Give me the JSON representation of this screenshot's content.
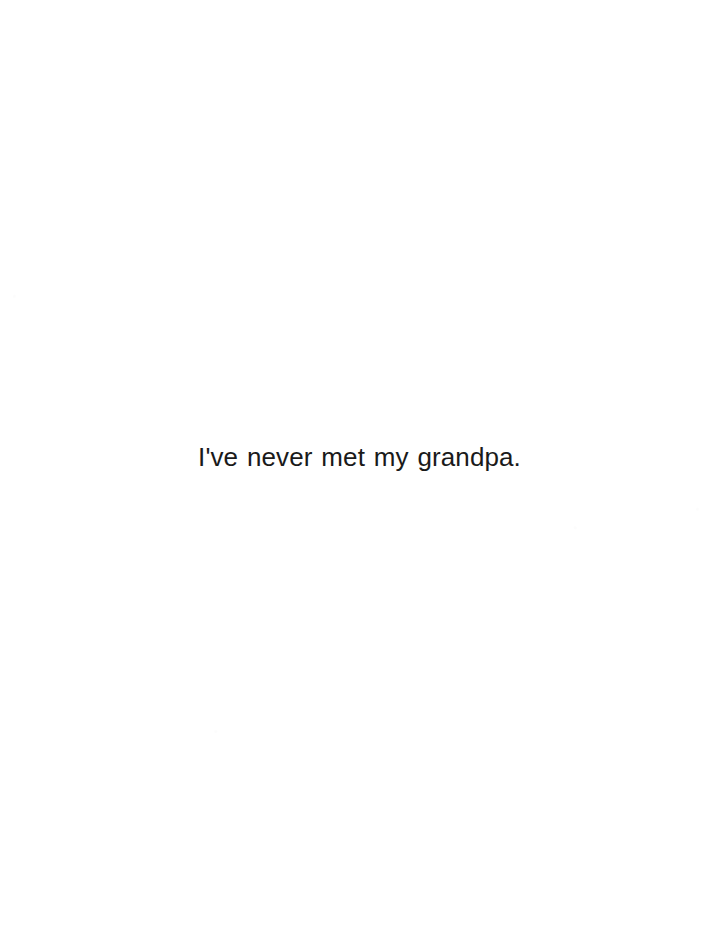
{
  "page": {
    "background_color": "#ffffff",
    "width": 719,
    "height": 926
  },
  "body_text": {
    "line": "I've never met my grandpa.",
    "color": "#1a1a1a",
    "alignment": "center"
  }
}
